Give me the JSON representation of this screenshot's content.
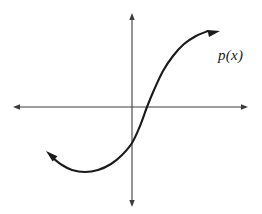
{
  "figure": {
    "width": 262,
    "height": 214,
    "background_color": "#ffffff",
    "curve_label": "p(x)",
    "curve_color": "#1a1a1a",
    "axis_color": "#3d3d3d"
  },
  "chart_data": {
    "type": "line",
    "title": "",
    "xlabel": "",
    "ylabel": "",
    "grid": false,
    "legend": "none",
    "annotations": [
      {
        "text": "p(x)",
        "x_px": 218,
        "y_px": 48,
        "style": "italic-serif",
        "describes": "cubic-curve"
      }
    ],
    "axes": {
      "x_axis": {
        "y_px": 107,
        "x_start_px": 13,
        "x_end_px": 248,
        "arrow_start": true,
        "arrow_end": true,
        "tick_labels": []
      },
      "y_axis": {
        "x_px": 132,
        "y_start_px": 13,
        "y_end_px": 207,
        "arrow_start": true,
        "arrow_end": true,
        "tick_labels": []
      },
      "origin_px": [
        132,
        107
      ]
    },
    "series": [
      {
        "name": "p(x)",
        "shape": "cubic S-curve, increasing overall",
        "arrow_start": true,
        "arrow_end": true,
        "points_px": [
          [
            46,
            151
          ],
          [
            53,
            158
          ],
          [
            62,
            165
          ],
          [
            72,
            170
          ],
          [
            85,
            172
          ],
          [
            98,
            170
          ],
          [
            111,
            164
          ],
          [
            122,
            155
          ],
          [
            132,
            143
          ],
          [
            140,
            126
          ],
          [
            147,
            107
          ],
          [
            154,
            90
          ],
          [
            163,
            71
          ],
          [
            173,
            56
          ],
          [
            184,
            44
          ],
          [
            196,
            36
          ],
          [
            208,
            31
          ],
          [
            218,
            31
          ]
        ],
        "features": {
          "left_arrow_tip_px": [
            46,
            151
          ],
          "local_minimum_px": [
            85,
            172
          ],
          "x_intercept_px": [
            147,
            107
          ],
          "inflection_px": [
            147,
            107
          ],
          "local_maximum_px": [
            216,
            31
          ],
          "right_arrow_tip_px": [
            220,
            31
          ]
        }
      }
    ]
  }
}
